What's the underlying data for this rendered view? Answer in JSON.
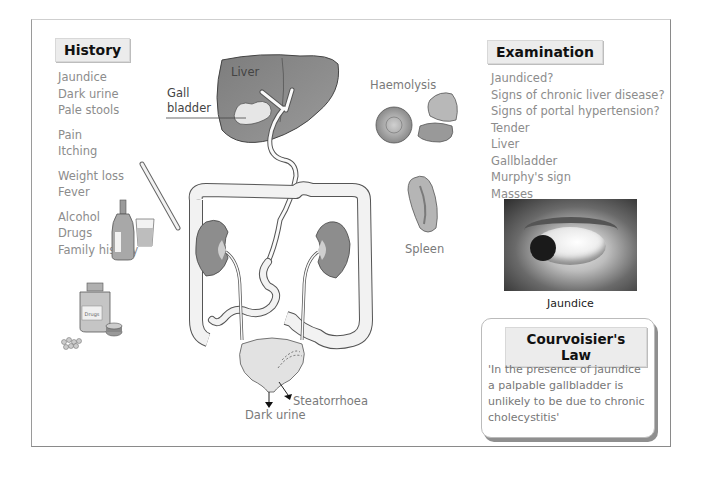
{
  "history": {
    "title": "History",
    "groups": [
      [
        "Jaundice",
        "Dark urine",
        "Pale stools"
      ],
      [
        "Pain",
        "Itching"
      ],
      [
        "Weight loss",
        "Fever"
      ],
      [
        "Alcohol",
        "Drugs",
        "Family history"
      ]
    ]
  },
  "examination": {
    "title": "Examination",
    "items": [
      "Jaundiced?",
      "Signs of chronic liver disease?",
      "Signs of portal hypertension?",
      "Tender",
      "Liver",
      "Gallbladder",
      "Murphy's sign",
      "Masses"
    ]
  },
  "diagram": {
    "labels": {
      "liver": "Liver",
      "gallbladder_line1": "Gall",
      "gallbladder_line2": "bladder",
      "haemolysis": "Haemolysis",
      "spleen": "Spleen",
      "steatorrhoea": "Steatorrhoea",
      "dark_urine": "Dark urine",
      "drugs_bottle": "Drugs"
    }
  },
  "photo": {
    "caption": "Jaundice"
  },
  "courvoisier": {
    "title": "Courvoisier's Law",
    "text": "'In the presence of jaundice a palpable gallbladder is unlikely to be due to chronic cholecystitis'"
  },
  "colors": {
    "frame": "#8a8a8a",
    "header_bg": "#ececec",
    "text_grey": "#8c8c8c",
    "organ_dark": "#8d8d8d",
    "organ_light": "#e6e6e6"
  }
}
